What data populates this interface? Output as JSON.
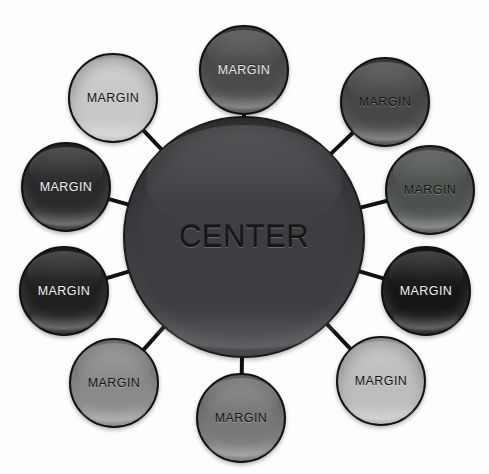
{
  "diagram": {
    "type": "hub-and-spoke radial diagram",
    "background_color": "#fdfdfd",
    "spoke_color": "#111111",
    "spoke_width": 4,
    "center": {
      "label": "CENTER",
      "cx": 244,
      "cy": 237,
      "r": 121,
      "fill": "#3e3e42",
      "text_color": "#17171a",
      "outline": "#1b1b1b"
    },
    "margin_nodes": [
      {
        "label": "MARGIN",
        "position": "top",
        "angle": -90,
        "cx": 244,
        "cy": 70,
        "r": 45,
        "fill": "#4a4a4a",
        "text_color": "#e8e8e8"
      },
      {
        "label": "MARGIN",
        "position": "top-right",
        "angle": -54,
        "cx": 385,
        "cy": 102,
        "r": 45,
        "fill": "#474747",
        "text_color": "#141414"
      },
      {
        "label": "MARGIN",
        "position": "right-upper",
        "angle": -18,
        "cx": 430,
        "cy": 190,
        "r": 45,
        "fill": "#4e524e",
        "text_color": "#141414"
      },
      {
        "label": "MARGIN",
        "position": "right-lower",
        "angle": 18,
        "cx": 426,
        "cy": 291,
        "r": 45,
        "fill": "#161616",
        "text_color": "#f2f2f2"
      },
      {
        "label": "MARGIN",
        "position": "bottom-right",
        "angle": 54,
        "cx": 381,
        "cy": 381,
        "r": 45,
        "fill": "#bdbdbd",
        "text_color": "#141414"
      },
      {
        "label": "MARGIN",
        "position": "bottom",
        "angle": 90,
        "cx": 241,
        "cy": 418,
        "r": 45,
        "fill": "#787878",
        "text_color": "#141414"
      },
      {
        "label": "MARGIN",
        "position": "bottom-left",
        "angle": 126,
        "cx": 114,
        "cy": 383,
        "r": 45,
        "fill": "#8a8a8a",
        "text_color": "#141414"
      },
      {
        "label": "MARGIN",
        "position": "left-lower",
        "angle": 162,
        "cx": 64,
        "cy": 291,
        "r": 45,
        "fill": "#202020",
        "text_color": "#f2f2f2"
      },
      {
        "label": "MARGIN",
        "position": "left-upper",
        "angle": -162,
        "cx": 66,
        "cy": 187,
        "r": 45,
        "fill": "#2a2a2a",
        "text_color": "#f2f2f2"
      },
      {
        "label": "MARGIN",
        "position": "top-left",
        "angle": -126,
        "cx": 113,
        "cy": 98,
        "r": 45,
        "fill": "#c8c8c8",
        "text_color": "#141414"
      }
    ]
  }
}
